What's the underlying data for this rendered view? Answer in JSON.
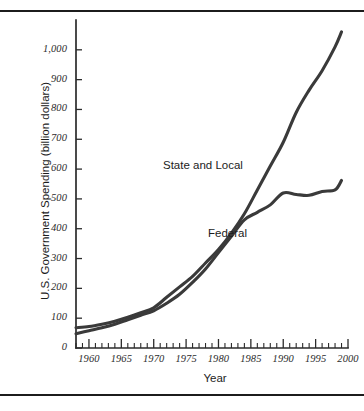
{
  "figure": {
    "background_color": "#ffffff",
    "line_color": "#3a3a3a",
    "axis_color": "#2b2b2b",
    "rule_top": "horizontal-rule",
    "rule_bottom": "horizontal-rule"
  },
  "chart_data": {
    "type": "line",
    "title": "",
    "xlabel": "Year",
    "ylabel": "U.S. Government Spending (billion dollars)",
    "xlim": [
      1958,
      2000
    ],
    "ylim": [
      0,
      1100
    ],
    "grid": false,
    "legend": "inline-labels",
    "x_ticks": [
      1960,
      1965,
      1970,
      1975,
      1980,
      1985,
      1990,
      1995,
      2000
    ],
    "x_tick_labels": [
      "1960",
      "1965",
      "1970",
      "1975",
      "1980",
      "1985",
      "1990",
      "1995",
      "2000"
    ],
    "x_minor_tick_interval": 1,
    "y_ticks": [
      0,
      100,
      200,
      300,
      400,
      500,
      600,
      700,
      800,
      900,
      1000
    ],
    "y_tick_labels": [
      "0",
      "100",
      "200",
      "300",
      "400",
      "500",
      "600",
      "700",
      "800",
      "900",
      "1,000"
    ],
    "x": [
      1958,
      1960,
      1962,
      1964,
      1966,
      1968,
      1970,
      1972,
      1974,
      1976,
      1978,
      1980,
      1982,
      1984,
      1986,
      1988,
      1990,
      1992,
      1994,
      1996,
      1998,
      1999
    ],
    "series": [
      {
        "name": "State and Local",
        "label": "State and Local",
        "label_x": 1977,
        "label_y": 625,
        "values": [
          68,
          72,
          80,
          90,
          103,
          118,
          135,
          170,
          205,
          240,
          285,
          330,
          385,
          450,
          530,
          610,
          690,
          790,
          865,
          930,
          1010,
          1060
        ]
      },
      {
        "name": "Federal",
        "label": "Federal",
        "label_x": 1985,
        "label_y": 395,
        "values": [
          48,
          58,
          68,
          80,
          95,
          110,
          125,
          150,
          180,
          220,
          265,
          320,
          375,
          430,
          455,
          480,
          520,
          515,
          512,
          525,
          530,
          562
        ]
      }
    ]
  }
}
